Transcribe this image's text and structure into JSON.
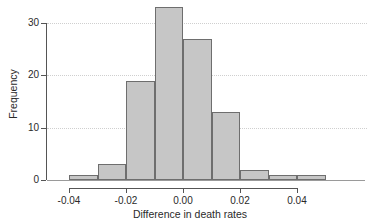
{
  "chart_data": {
    "type": "bar",
    "subtype": "histogram",
    "title": "",
    "xlabel": "Difference in death rates",
    "ylabel": "Frequency",
    "bin_width": 0.01,
    "bin_edges": [
      -0.04,
      -0.03,
      -0.02,
      -0.01,
      0.0,
      0.01,
      0.02,
      0.03,
      0.04,
      0.05
    ],
    "categories": [
      "-0.04 to -0.03",
      "-0.03 to -0.02",
      "-0.02 to -0.01",
      "-0.01 to 0.00",
      "0.00 to 0.01",
      "0.01 to 0.02",
      "0.02 to 0.03",
      "0.03 to 0.04",
      "0.04 to 0.05"
    ],
    "values": [
      1,
      3,
      19,
      33,
      27,
      13,
      2,
      1,
      1
    ],
    "xlim": [
      -0.045,
      0.055
    ],
    "ylim": [
      0,
      34
    ],
    "xticks": [
      -0.04,
      -0.02,
      0.0,
      0.02,
      0.04
    ],
    "xticklabels": [
      "-0.04",
      "-0.02",
      "0.00",
      "0.02",
      "0.04"
    ],
    "yticks": [
      0,
      10,
      20,
      30
    ],
    "yticklabels": [
      "0",
      "10",
      "20",
      "30"
    ],
    "grid": "horizontal-dotted",
    "legend": "none",
    "bar_fill_color": "#c6c6c6",
    "bar_border_color": "#6e6e6e",
    "axis_color": "#555555",
    "grid_color": "#cfcfcf"
  }
}
